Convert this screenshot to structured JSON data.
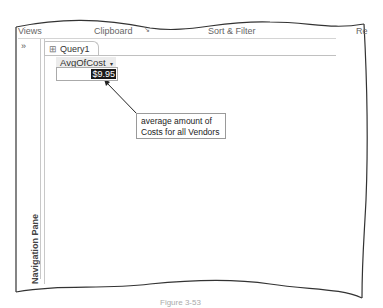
{
  "ribbon": {
    "groups": [
      {
        "label": "Views"
      },
      {
        "label": "Clipboard"
      },
      {
        "label": "Sort & Filter"
      },
      {
        "label": "Re"
      }
    ]
  },
  "navigation_pane": {
    "expand_glyph": "»",
    "label": "Navigation Pane"
  },
  "tab": {
    "label": "Query1",
    "icon": "query-icon"
  },
  "datasheet": {
    "columns": [
      {
        "header": "AvgOfCost",
        "sort_glyph": "▾"
      }
    ],
    "rows": [
      [
        "$9.95"
      ]
    ]
  },
  "callout": {
    "text": "average amount of Costs for all Vendors"
  },
  "caption": {
    "text": "Figure 3-53"
  }
}
